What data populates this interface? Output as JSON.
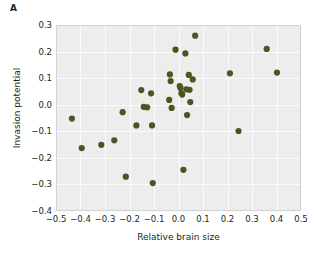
{
  "panel": {
    "label": "A"
  },
  "axes": {
    "x_title": "Relative brain size",
    "y_title": "Invasion potential",
    "x_ticks": [
      "−0.5",
      "−0.4",
      "−0.3",
      "−0.2",
      "−0.1",
      "0.0",
      "0.1",
      "0.2",
      "0.3",
      "0.4",
      "0.5"
    ],
    "y_ticks": [
      "0.3",
      "0.2",
      "0.1",
      "0.0",
      "−0.1",
      "−0.2",
      "−0.3",
      "−0.4"
    ]
  },
  "colors": {
    "marker": "#4f5320",
    "plot_background": "#ededed",
    "gridline": "#fbfbfb",
    "frame": "#d2d2d2",
    "text": "#231f20",
    "page_background": "#ffffff"
  },
  "chart_data": {
    "type": "scatter",
    "title": "A",
    "xlabel": "Relative brain size",
    "ylabel": "Invasion potential",
    "xlim": [
      -0.5,
      0.5
    ],
    "ylim": [
      -0.4,
      0.3
    ],
    "xticks": [
      -0.5,
      -0.4,
      -0.3,
      -0.2,
      -0.1,
      0.0,
      0.1,
      0.2,
      0.3,
      0.4,
      0.5
    ],
    "yticks": [
      0.3,
      0.2,
      0.1,
      0.0,
      -0.1,
      -0.2,
      -0.3,
      -0.4
    ],
    "grid": true,
    "legend": "none",
    "marker_color": "#4f5320",
    "marker_size": 3.1,
    "series": [
      {
        "name": "species",
        "points": [
          {
            "x": -0.435,
            "y": -0.052
          },
          {
            "x": -0.395,
            "y": -0.163
          },
          {
            "x": -0.315,
            "y": -0.151
          },
          {
            "x": -0.262,
            "y": -0.134
          },
          {
            "x": -0.228,
            "y": -0.028
          },
          {
            "x": -0.215,
            "y": -0.271
          },
          {
            "x": -0.172,
            "y": -0.078
          },
          {
            "x": -0.152,
            "y": 0.055
          },
          {
            "x": -0.142,
            "y": -0.008
          },
          {
            "x": -0.128,
            "y": -0.01
          },
          {
            "x": -0.112,
            "y": 0.043
          },
          {
            "x": -0.108,
            "y": -0.078
          },
          {
            "x": -0.105,
            "y": -0.295
          },
          {
            "x": -0.038,
            "y": 0.018
          },
          {
            "x": -0.035,
            "y": 0.114
          },
          {
            "x": -0.032,
            "y": 0.089
          },
          {
            "x": -0.028,
            "y": -0.012
          },
          {
            "x": -0.012,
            "y": 0.207
          },
          {
            "x": 0.005,
            "y": 0.07
          },
          {
            "x": 0.008,
            "y": 0.063
          },
          {
            "x": 0.012,
            "y": 0.043
          },
          {
            "x": 0.015,
            "y": 0.038
          },
          {
            "x": 0.02,
            "y": -0.245
          },
          {
            "x": 0.028,
            "y": 0.193
          },
          {
            "x": 0.032,
            "y": 0.058
          },
          {
            "x": 0.035,
            "y": -0.039
          },
          {
            "x": 0.042,
            "y": 0.112
          },
          {
            "x": 0.045,
            "y": 0.056
          },
          {
            "x": 0.048,
            "y": 0.01
          },
          {
            "x": 0.058,
            "y": 0.095
          },
          {
            "x": 0.068,
            "y": 0.26
          },
          {
            "x": 0.21,
            "y": 0.118
          },
          {
            "x": 0.245,
            "y": -0.099
          },
          {
            "x": 0.36,
            "y": 0.21
          },
          {
            "x": 0.402,
            "y": 0.121
          }
        ]
      }
    ]
  }
}
